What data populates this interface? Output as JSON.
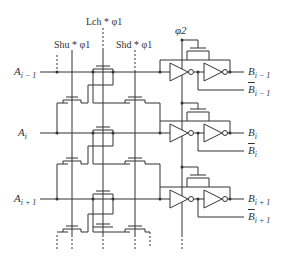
{
  "diagram": {
    "type": "shift register / latch cell array schematic",
    "control_signals": {
      "shift_up": "Shu * φ1",
      "latch": "Lch * φ1",
      "shift_down": "Shd * φ1",
      "clock2": "φ2"
    },
    "inputs": [
      {
        "base": "A",
        "sub": "i − 1"
      },
      {
        "base": "A",
        "sub": "i"
      },
      {
        "base": "A",
        "sub": "i + 1"
      }
    ],
    "outputs": [
      {
        "base": "B",
        "sub": "i − 1",
        "inverted": false
      },
      {
        "base": "B",
        "sub": "i − 1",
        "inverted": true
      },
      {
        "base": "B",
        "sub": "i",
        "inverted": false
      },
      {
        "base": "B",
        "sub": "i",
        "inverted": true
      },
      {
        "base": "B",
        "sub": "i + 1",
        "inverted": false
      },
      {
        "base": "B",
        "sub": "i + 1",
        "inverted": true
      }
    ],
    "colors": {
      "line": "#333333",
      "background": "#ffffff"
    }
  }
}
